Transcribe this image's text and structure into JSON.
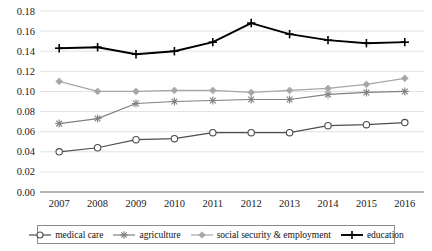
{
  "chart_data": {
    "type": "line",
    "title": "",
    "subtitle": "",
    "xlabel": "",
    "ylabel": "",
    "categories": [
      "2007",
      "2008",
      "2009",
      "2010",
      "2011",
      "2012",
      "2013",
      "2014",
      "2015",
      "2016"
    ],
    "x": [
      2007,
      2008,
      2009,
      2010,
      2011,
      2012,
      2013,
      2014,
      2015,
      2016
    ],
    "ylim": [
      0.0,
      0.18
    ],
    "y_ticks": [
      0.0,
      0.02,
      0.04,
      0.06,
      0.08,
      0.1,
      0.12,
      0.14,
      0.16,
      0.18
    ],
    "y_tick_labels": [
      "0.00",
      "0.02",
      "0.04",
      "0.06",
      "0.08",
      "0.10",
      "0.12",
      "0.14",
      "0.16",
      "0.18"
    ],
    "grid": true,
    "grid_axis": "y",
    "legend_position": "bottom",
    "series": [
      {
        "name": "medical care",
        "marker": "circle",
        "color": "#4d4d4d",
        "values": [
          0.04,
          0.044,
          0.052,
          0.053,
          0.059,
          0.059,
          0.059,
          0.066,
          0.067,
          0.069
        ]
      },
      {
        "name": "agriculture",
        "marker": "asterisk",
        "color": "#808080",
        "values": [
          0.068,
          0.073,
          0.088,
          0.09,
          0.091,
          0.092,
          0.092,
          0.097,
          0.099,
          0.1
        ]
      },
      {
        "name": "social security & employment",
        "marker": "diamond",
        "color": "#a6a6a6",
        "values": [
          0.11,
          0.1,
          0.1,
          0.101,
          0.101,
          0.099,
          0.101,
          0.103,
          0.107,
          0.113
        ]
      },
      {
        "name": "education",
        "marker": "plus",
        "color": "#000000",
        "values": [
          0.143,
          0.144,
          0.137,
          0.14,
          0.149,
          0.168,
          0.157,
          0.151,
          0.148,
          0.149
        ]
      }
    ]
  },
  "legend": {
    "entries": [
      {
        "label": "medical care",
        "marker": "circle-marker-icon",
        "color": "#4d4d4d"
      },
      {
        "label": "agriculture",
        "marker": "asterisk-marker-icon",
        "color": "#808080"
      },
      {
        "label": "social security & employment",
        "marker": "diamond-marker-icon",
        "color": "#a6a6a6"
      },
      {
        "label": "education",
        "marker": "plus-marker-icon",
        "color": "#000000"
      }
    ]
  },
  "colors": {
    "grid": "#d9d9d9",
    "axis": "#6b6b6b",
    "background": "#ffffff",
    "text": "#1a1a1a"
  }
}
